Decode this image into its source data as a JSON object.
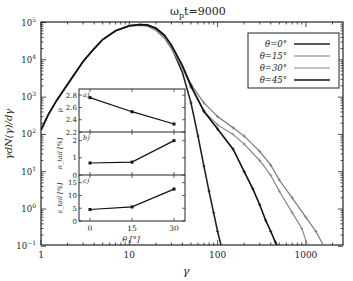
{
  "chart_data": [
    {
      "type": "line",
      "title": "ω_p t=9000",
      "title_parts": {
        "base": "ω",
        "sub": "p",
        "rest": "t=9000"
      },
      "xlabel": "γ",
      "ylabel": "γdN(γ)/dγ",
      "xscale": "log",
      "yscale": "log",
      "xlim": [
        1,
        2500
      ],
      "ylim": [
        0.1,
        100000
      ],
      "x_ticks": [
        {
          "v": 1,
          "label": "1"
        },
        {
          "v": 10,
          "label": "10"
        },
        {
          "v": 100,
          "label": "100"
        },
        {
          "v": 1000,
          "label": "1000"
        }
      ],
      "y_ticks": [
        {
          "v": 100000,
          "base": "10",
          "exp": "5"
        },
        {
          "v": 10000,
          "base": "10",
          "exp": "4"
        },
        {
          "v": 1000,
          "base": "10",
          "exp": "3"
        },
        {
          "v": 100,
          "base": "10",
          "exp": "2"
        },
        {
          "v": 10,
          "base": "10",
          "exp": "1"
        },
        {
          "v": 1,
          "base": "10",
          "exp": "0"
        },
        {
          "v": 0.1,
          "base": "10",
          "exp": "−1"
        }
      ],
      "grid": false,
      "legend_position": "upper right",
      "series": [
        {
          "name": "θ=0°",
          "color": "#222222",
          "width": 1.6,
          "x": [
            1,
            1.2,
            1.5,
            2,
            3,
            4,
            5,
            7,
            10,
            13,
            16,
            20,
            25,
            30,
            40,
            50,
            60,
            70,
            80,
            90,
            100,
            110
          ],
          "y": [
            130,
            330,
            800,
            2200,
            9000,
            20000,
            35000,
            60000,
            82000,
            88000,
            85000,
            70000,
            45000,
            22000,
            4500,
            700,
            90,
            14,
            3,
            0.8,
            0.25,
            0.1
          ]
        },
        {
          "name": "θ=15°",
          "color": "#777777",
          "width": 1.2,
          "x": [
            1,
            1.2,
            1.5,
            2,
            3,
            4,
            5,
            7,
            10,
            13,
            16,
            20,
            25,
            30,
            40,
            50,
            70,
            100,
            150,
            200,
            300,
            400,
            500,
            700,
            1000,
            1300,
            1600
          ],
          "y": [
            130,
            330,
            800,
            2200,
            9000,
            20000,
            35000,
            60000,
            80000,
            84000,
            80000,
            62000,
            38000,
            20000,
            6000,
            2200,
            700,
            300,
            150,
            90,
            35,
            15,
            6,
            2,
            0.6,
            0.25,
            0.1
          ]
        },
        {
          "name": "θ=30°",
          "color": "#888888",
          "width": 1.2,
          "x": [
            1,
            1.2,
            1.5,
            2,
            3,
            4,
            5,
            7,
            10,
            13,
            16,
            20,
            25,
            30,
            40,
            50,
            70,
            100,
            150,
            200,
            300,
            400,
            500,
            700,
            900,
            1050
          ],
          "y": [
            130,
            330,
            800,
            2200,
            9000,
            20000,
            35000,
            60000,
            80000,
            85000,
            82000,
            65000,
            42000,
            22000,
            6000,
            1800,
            420,
            180,
            100,
            55,
            20,
            8,
            3,
            0.8,
            0.3,
            0.1
          ]
        },
        {
          "name": "θ=45°",
          "color": "#111111",
          "width": 1.6,
          "x": [
            1,
            1.2,
            1.5,
            2,
            3,
            4,
            5,
            7,
            10,
            13,
            16,
            20,
            25,
            30,
            40,
            50,
            70,
            100,
            150,
            200,
            250,
            300,
            350,
            400,
            450,
            480
          ],
          "y": [
            130,
            330,
            800,
            2200,
            9000,
            20000,
            35000,
            60000,
            82000,
            88000,
            86000,
            70000,
            46000,
            25000,
            7000,
            2000,
            420,
            140,
            40,
            10,
            3.5,
            1.3,
            0.5,
            0.25,
            0.13,
            0.1
          ]
        }
      ]
    },
    {
      "type": "line",
      "panel": "a)",
      "ylabel": "p",
      "x": [
        0,
        15,
        30
      ],
      "values": [
        2.76,
        2.53,
        2.33
      ],
      "ylim": [
        2.2,
        2.9
      ],
      "y_ticks": [
        "2.2",
        "2.4",
        "2.6",
        "2.8"
      ]
    },
    {
      "type": "line",
      "panel": "b)",
      "ylabel": "n_tail [%]",
      "x": [
        0,
        15,
        30
      ],
      "values": [
        0.7,
        0.75,
        2.0
      ],
      "ylim": [
        0,
        2.5
      ],
      "y_ticks": [
        "0",
        "1",
        "2"
      ]
    },
    {
      "type": "line",
      "panel": "c)",
      "ylabel": "ε_tail [%]",
      "x": [
        0,
        15,
        30
      ],
      "values": [
        4.5,
        5.5,
        12.5
      ],
      "ylim": [
        0,
        18
      ],
      "y_ticks": [
        "0",
        "5",
        "10",
        "15"
      ],
      "xlabel": "θ [°]",
      "x_ticks": [
        "0",
        "15",
        "30"
      ]
    }
  ],
  "labels": {
    "title_base": "ω",
    "title_sub": "p",
    "title_rest": "t=9000",
    "xlabel": "γ",
    "ylabel": "γdN(γ)/dγ",
    "inset_xlabel": "θ [°]"
  },
  "legend": [
    {
      "label": "θ=0°",
      "color": "#222222",
      "width": 1.6
    },
    {
      "label": "θ=15°",
      "color": "#777777",
      "width": 1.2
    },
    {
      "label": "θ=30°",
      "color": "#888888",
      "width": 1.2
    },
    {
      "label": "θ=45°",
      "color": "#111111",
      "width": 1.6
    }
  ]
}
